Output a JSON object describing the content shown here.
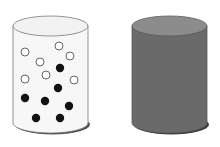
{
  "diagram": {
    "title": "",
    "cylinders": [
      {
        "name": "transparent-cylinder",
        "fill": "#f7f7f7",
        "top_fill": "#f2f2f2",
        "stroke": "#7a7a7a",
        "shadow": "#555555",
        "particles": {
          "open_count": 7,
          "filled_count": 7,
          "open_color": "#ffffff",
          "filled_color": "#111111"
        }
      },
      {
        "name": "opaque-cylinder",
        "fill": "#6a6a6a",
        "top_fill": "#8c8c8c",
        "stroke": "#5a5a5a",
        "shadow": "#3c3c3c"
      }
    ]
  }
}
